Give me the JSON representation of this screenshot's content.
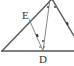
{
  "diagram": {
    "type": "geometry",
    "labels": [
      {
        "id": "E",
        "text": "E",
        "x": 22,
        "y": 19
      },
      {
        "id": "D",
        "text": "D",
        "x": 39,
        "y": 63
      }
    ],
    "colors": {
      "line": "#555555",
      "text": "#333333",
      "background": "#ffffff"
    }
  }
}
